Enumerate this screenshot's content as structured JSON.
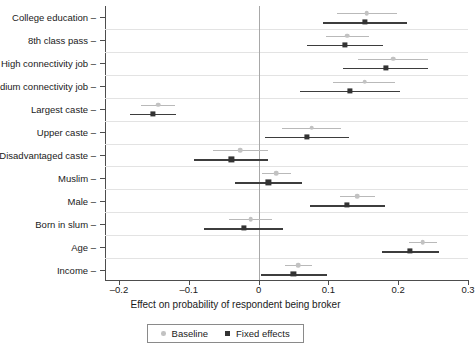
{
  "chart_data": {
    "type": "scatter",
    "title": "",
    "xlabel": "Effect on probability of respondent being broker",
    "ylabel": "",
    "xlim": [
      -0.22,
      0.3
    ],
    "xticks": [
      -0.2,
      -0.1,
      0,
      0.1,
      0.2,
      0.3
    ],
    "xticklabels": [
      "–0.2",
      "–0.1",
      "0",
      "0.1",
      "0.2",
      "0.3"
    ],
    "grid": "horizontal",
    "reference_line": 0,
    "legend_position": "bottom-center",
    "orientation": "horizontal-coefficient-plot",
    "categories": [
      "College education",
      "8th class pass",
      "High connectivity job",
      "Medium connectivity job",
      "Largest caste",
      "Upper caste",
      "Disadvantaged caste",
      "Muslim",
      "Male",
      "Born in slum",
      "Age",
      "Income"
    ],
    "series": [
      {
        "name": "Baseline",
        "color": "#c2c2c2",
        "marker": "circle",
        "values": [
          0.155,
          0.127,
          0.193,
          0.152,
          -0.144,
          0.076,
          -0.026,
          0.025,
          0.141,
          -0.011,
          0.235,
          0.057
        ],
        "ci_lower": [
          0.113,
          0.097,
          0.143,
          0.107,
          -0.168,
          0.034,
          -0.066,
          0.005,
          0.116,
          -0.042,
          0.215,
          0.038
        ],
        "ci_upper": [
          0.198,
          0.158,
          0.242,
          0.195,
          -0.12,
          0.118,
          0.014,
          0.046,
          0.167,
          0.019,
          0.255,
          0.076
        ]
      },
      {
        "name": "Fixed effects",
        "color": "#333333",
        "marker": "square",
        "values": [
          0.152,
          0.124,
          0.182,
          0.131,
          -0.151,
          0.069,
          -0.039,
          0.014,
          0.127,
          -0.021,
          0.217,
          0.05
        ],
        "ci_lower": [
          0.092,
          0.069,
          0.121,
          0.06,
          -0.184,
          0.009,
          -0.093,
          -0.034,
          0.073,
          -0.078,
          0.177,
          0.003
        ],
        "ci_upper": [
          0.213,
          0.178,
          0.243,
          0.203,
          -0.118,
          0.13,
          0.014,
          0.062,
          0.181,
          0.035,
          0.258,
          0.098
        ]
      }
    ]
  },
  "legend": {
    "items": [
      {
        "label": "Baseline"
      },
      {
        "label": "Fixed effects"
      }
    ]
  }
}
